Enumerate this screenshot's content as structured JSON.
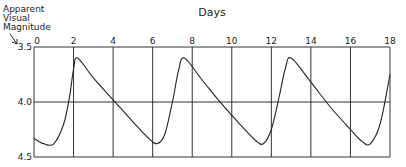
{
  "chart_data": {
    "type": "line",
    "title": "",
    "xlabel": "Days",
    "ylabel": "Apparent Visual Magnitude",
    "ylabel_lines": [
      "Apparent",
      "Visual",
      "Magnitude"
    ],
    "x_ticks": [
      0,
      2,
      4,
      6,
      8,
      10,
      12,
      14,
      16,
      18
    ],
    "y_ticks": [
      3.5,
      4.0,
      4.5
    ],
    "y_tick_labels": [
      "3.5",
      "4.0",
      "4.5"
    ],
    "xlim": [
      0,
      18
    ],
    "ylim": [
      4.5,
      3.5
    ],
    "y_inverted": true,
    "grid": true,
    "legend": null,
    "series": [
      {
        "name": "Cepheid light curve",
        "x": [
          0,
          0.5,
          1.0,
          1.5,
          1.8,
          2.0,
          2.2,
          3.0,
          4.0,
          5.0,
          5.8,
          6.2,
          6.6,
          7.0,
          7.3,
          7.6,
          8.5,
          9.5,
          10.5,
          11.2,
          11.6,
          12.0,
          12.4,
          12.7,
          13.0,
          14.0,
          15.0,
          16.0,
          16.6,
          17.0,
          17.5,
          18.0
        ],
        "values": [
          4.33,
          4.38,
          4.38,
          4.2,
          3.95,
          3.7,
          3.6,
          3.78,
          3.98,
          4.18,
          4.33,
          4.38,
          4.3,
          4.0,
          3.72,
          3.6,
          3.8,
          4.02,
          4.22,
          4.35,
          4.38,
          4.25,
          3.95,
          3.7,
          3.6,
          3.82,
          4.05,
          4.25,
          4.36,
          4.38,
          4.2,
          3.75
        ]
      }
    ]
  }
}
